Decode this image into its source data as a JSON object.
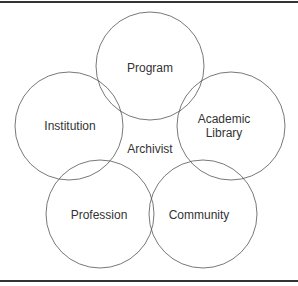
{
  "diagram": {
    "center_label": "Archivist",
    "circles": [
      {
        "label": [
          "Program"
        ]
      },
      {
        "label": [
          "Institution"
        ]
      },
      {
        "label": [
          "Academic",
          "Library"
        ]
      },
      {
        "label": [
          "Profession"
        ]
      },
      {
        "label": [
          "Community"
        ]
      }
    ],
    "stroke_color": "#555555",
    "text_color": "#333333"
  }
}
